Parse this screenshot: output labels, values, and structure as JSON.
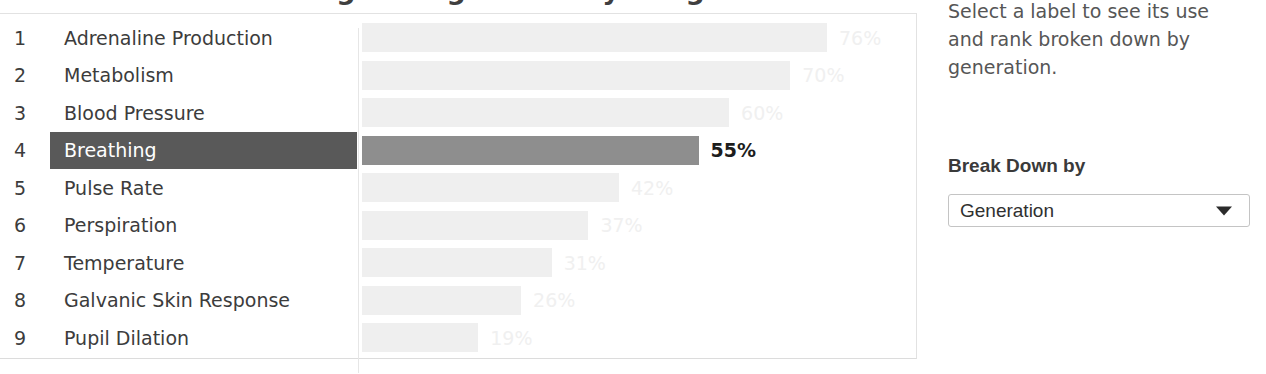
{
  "title_remnant": "Organizing Labels by Usage",
  "chart_data": {
    "type": "bar",
    "title": "",
    "xlabel": "",
    "ylabel": "",
    "xlim": [
      0,
      100
    ],
    "grid": false,
    "orientation": "horizontal",
    "unit": "%",
    "categories": [
      "Adrenaline Production",
      "Metabolism",
      "Blood Pressure",
      "Breathing",
      "Pulse Rate",
      "Perspiration",
      "Temperature",
      "Galvanic Skin Response",
      "Pupil Dilation"
    ],
    "values": [
      76,
      70,
      60,
      55,
      42,
      37,
      31,
      26,
      19
    ],
    "value_labels": [
      "76%",
      "70%",
      "60%",
      "55%",
      "42%",
      "37%",
      "31%",
      "26%",
      "19%"
    ],
    "ranks": [
      "1",
      "2",
      "3",
      "4",
      "5",
      "6",
      "7",
      "8",
      "9"
    ],
    "selected_index": 3,
    "selected_category": "Breathing",
    "colors": {
      "bar_default": "#efefef",
      "bar_selected": "#8e8e8e",
      "label_selected_bg": "#595959",
      "label_selected_text": "#ffffff",
      "value_default_text": "#f0f0f0",
      "value_selected_text": "#1d1d1d",
      "label_text": "#3c3c3c"
    }
  },
  "side_panel": {
    "hint": "Select a label to see its use and rank broken down by generation.",
    "breakdown_heading": "Break Down by",
    "breakdown_select": {
      "value": "Generation",
      "chevron_icon": "chevron-down-icon"
    }
  }
}
